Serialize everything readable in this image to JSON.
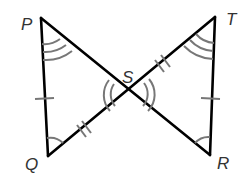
{
  "diagram": {
    "type": "two triangles meeting at a vertex (bowtie)",
    "points": {
      "P": {
        "label": "P",
        "x": 41,
        "y": 18
      },
      "T": {
        "label": "T",
        "x": 215,
        "y": 17
      },
      "Q": {
        "label": "Q",
        "x": 48,
        "y": 156
      },
      "R": {
        "label": "R",
        "x": 210,
        "y": 155
      },
      "S": {
        "label": "S",
        "x": 129,
        "y": 94
      }
    },
    "segments": [
      "PQ",
      "PR",
      "QT",
      "TR"
    ],
    "tick_marks": {
      "single": [
        "PQ",
        "TR"
      ],
      "double": [
        "QS",
        "ST"
      ]
    },
    "angle_marks": {
      "single_arc": [
        "PQS",
        "TRS"
      ],
      "double_arc": [
        "PSQ",
        "TSR"
      ],
      "triple_arc": [
        "QPS",
        "STR"
      ]
    },
    "colors": {
      "lines": "#000000",
      "marks": "#777777",
      "labels": "#333333"
    }
  }
}
